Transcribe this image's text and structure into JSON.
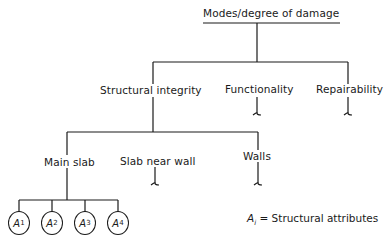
{
  "diagram": {
    "root": {
      "label": "Modes/degree of damage"
    },
    "level1": [
      {
        "label": "Structural integrity"
      },
      {
        "label": "Functionality"
      },
      {
        "label": "Repairability"
      }
    ],
    "level2": [
      {
        "label": "Main slab"
      },
      {
        "label": "Slab near wall"
      },
      {
        "label": "Walls"
      }
    ],
    "leaves": [
      {
        "base": "A",
        "sub": "1"
      },
      {
        "base": "A",
        "sub": "2"
      },
      {
        "base": "A",
        "sub": "3"
      },
      {
        "base": "A",
        "sub": "4"
      }
    ],
    "legend": {
      "symbol": "A",
      "sub": "i",
      "text": "= Structural attributes"
    }
  }
}
